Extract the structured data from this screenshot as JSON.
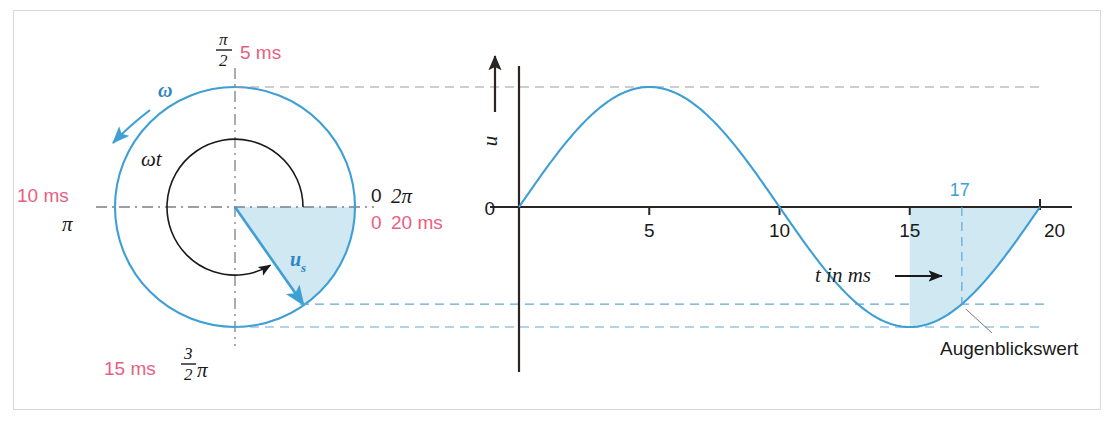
{
  "figure": {
    "title_hidden": "",
    "bg_color": "#ffffff",
    "frame_color": "#d8d8d8",
    "accent_blue": "#3d9fd4",
    "accent_red": "#e8607f",
    "fill_blue": "#cfe8f2",
    "axis_black": "#2b2420"
  },
  "phasor": {
    "omega_label": "ω",
    "omega_t_label": "ωt",
    "vector_label_base": "u",
    "vector_label_sub": "s",
    "top": {
      "angle_text_num": "π",
      "angle_text_den": "2",
      "time_text": "5 ms"
    },
    "left": {
      "time_text": "10 ms",
      "angle_text": "π"
    },
    "right": {
      "angle_zero": "0",
      "angle_text": "2π",
      "time_zero": "0",
      "time_text": "20 ms"
    },
    "bottom": {
      "time_text": "15 ms",
      "angle_num": "3",
      "angle_den": "2",
      "angle_pi": "π"
    },
    "rotation_direction": "counterclockwise",
    "phasor_angle_deg": -55,
    "sector_from_deg": 0,
    "sector_to_deg": -55
  },
  "chart_data": {
    "type": "line",
    "title": "",
    "xlabel": "t in ms",
    "ylabel": "u",
    "xlim": [
      0,
      20
    ],
    "ylim": [
      -1,
      1
    ],
    "grid": false,
    "legend": "none",
    "x_ticks": [
      5,
      10,
      15,
      20
    ],
    "x_tick_labels": [
      "5",
      "10",
      "15",
      "20"
    ],
    "y_ticks": [
      0
    ],
    "y_tick_labels": [
      "0"
    ],
    "series": [
      {
        "name": "u(t)",
        "color": "#3d9fd4",
        "function": "sin(2*pi*t/20)",
        "x": [
          0,
          1,
          2,
          3,
          4,
          5,
          6,
          7,
          8,
          9,
          10,
          11,
          12,
          13,
          14,
          15,
          16,
          17,
          18,
          19,
          20
        ],
        "values": [
          0,
          0.309,
          0.588,
          0.809,
          0.951,
          1.0,
          0.951,
          0.809,
          0.588,
          0.309,
          0,
          -0.309,
          -0.588,
          -0.809,
          -0.951,
          -1.0,
          -0.951,
          -0.809,
          -0.588,
          -0.309,
          0
        ]
      }
    ],
    "annotations": [
      {
        "name": "instant-value-marker",
        "x_label": "17",
        "x_value": 17,
        "y_value": -0.809,
        "color": "#3d9fd4"
      },
      {
        "name": "instant-value-callout",
        "text": "Augenblickswert"
      }
    ],
    "shaded_region": {
      "from_x": 15,
      "to_x": 20,
      "color": "#cfe8f2"
    }
  },
  "labels": {
    "augenblickswert": "Augenblickswert",
    "t_in_ms": "t in ms",
    "u_axis": "u",
    "zero": "0",
    "marker_17": "17",
    "tick_5": "5",
    "tick_10": "10",
    "tick_15": "15",
    "tick_20": "20"
  }
}
